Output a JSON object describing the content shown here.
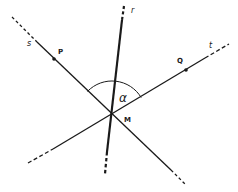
{
  "diagram": {
    "type": "geometry-lines-angle",
    "colors": {
      "stroke": "#1a1a1a",
      "background": "#ffffff"
    },
    "intersection": {
      "label": "M",
      "x": 112,
      "y": 115
    },
    "lines": [
      {
        "name": "s",
        "label": "s",
        "label_pos": [
          31,
          44
        ],
        "x1": 12,
        "y1": 17,
        "x2": 186,
        "y2": 185,
        "solid_from": [
          37,
          42
        ],
        "solid_to": [
          171,
          170
        ],
        "width": 1.3
      },
      {
        "name": "t",
        "label": "t",
        "label_pos": [
          210,
          45
        ],
        "x1": 28,
        "y1": 163,
        "x2": 229,
        "y2": 44,
        "solid_from": [
          53,
          149
        ],
        "solid_to": [
          205,
          58
        ],
        "width": 1.3
      },
      {
        "name": "r",
        "label": "r",
        "label_pos": [
          130,
          12
        ],
        "x1": 124,
        "y1": 6,
        "x2": 105,
        "y2": 174,
        "solid_from": [
          122,
          20
        ],
        "solid_to": [
          107,
          152
        ],
        "width": 2.2
      }
    ],
    "points": [
      {
        "label": "P",
        "x": 54,
        "y": 59,
        "label_x": 60,
        "label_y": 52
      },
      {
        "label": "Q",
        "x": 186,
        "y": 70,
        "label_x": 178,
        "label_y": 62
      }
    ],
    "angle": {
      "label": "α",
      "label_x": 120,
      "label_y": 100,
      "center": [
        112,
        115
      ],
      "radius": 34
    }
  }
}
